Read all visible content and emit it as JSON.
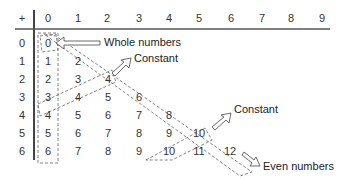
{
  "table": {
    "operator": "+",
    "column_headers": [
      "0",
      "1",
      "2",
      "3",
      "4",
      "5",
      "6",
      "7",
      "8",
      "9"
    ],
    "row_headers": [
      "0",
      "1",
      "2",
      "3",
      "4",
      "5",
      "6"
    ],
    "rows": [
      [
        "0"
      ],
      [
        "1",
        "2"
      ],
      [
        "2",
        "3",
        "4"
      ],
      [
        "3",
        "4",
        "5",
        "6"
      ],
      [
        "4",
        "5",
        "6",
        "7",
        "8"
      ],
      [
        "5",
        "6",
        "7",
        "8",
        "9",
        "10"
      ],
      [
        "6",
        "7",
        "8",
        "9",
        "10",
        "11",
        "12"
      ]
    ]
  },
  "annotations": {
    "whole_numbers": "Whole numbers",
    "constant_1": "Constant",
    "constant_2": "Constant",
    "even_numbers": "Even numbers"
  },
  "colors": {
    "text": "#333333",
    "lines": "#555555",
    "dashed": "#666666"
  }
}
